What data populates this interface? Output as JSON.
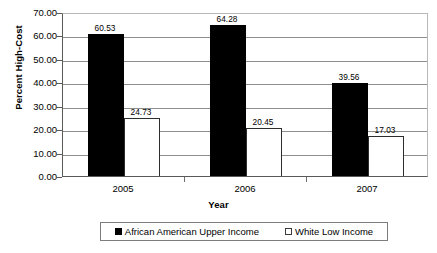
{
  "chart_data": {
    "type": "bar",
    "title": "",
    "xlabel": "Year",
    "ylabel": "Percent High-Cost",
    "categories": [
      "2005",
      "2006",
      "2007"
    ],
    "series": [
      {
        "name": "African American Upper Income",
        "swatch": "filled-square",
        "color": "#000000",
        "values": [
          60.53,
          64.28,
          39.56
        ],
        "labels": [
          "60.53",
          "64.28",
          "39.56"
        ]
      },
      {
        "name": "White Low Income",
        "swatch": "hollow-square",
        "color": "#ffffff",
        "values": [
          24.73,
          20.45,
          17.03
        ],
        "labels": [
          "24.73",
          "20.45",
          "17.03"
        ]
      }
    ],
    "ylim": [
      0,
      70
    ],
    "ytick_step": 10,
    "ytick_labels": [
      "70.00",
      "60.00",
      "50.00",
      "40.00",
      "30.00",
      "20.00",
      "10.00",
      "0.00"
    ],
    "ytick_values": [
      70,
      60,
      50,
      40,
      30,
      20,
      10,
      0
    ],
    "grid": true,
    "legend_position": "bottom"
  }
}
